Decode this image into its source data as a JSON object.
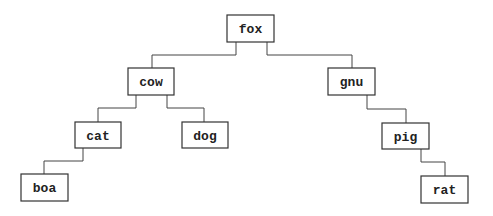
{
  "diagram": {
    "type": "binary-search-tree",
    "nodes": [
      {
        "id": "fox",
        "label": "fox",
        "x": 227,
        "y": 15,
        "w": 47,
        "h": 27
      },
      {
        "id": "cow",
        "label": "cow",
        "x": 128,
        "y": 68,
        "w": 46,
        "h": 27
      },
      {
        "id": "gnu",
        "label": "gnu",
        "x": 328,
        "y": 68,
        "w": 47,
        "h": 27
      },
      {
        "id": "cat",
        "label": "cat",
        "x": 75,
        "y": 122,
        "w": 46,
        "h": 26
      },
      {
        "id": "dog",
        "label": "dog",
        "x": 182,
        "y": 122,
        "w": 46,
        "h": 26
      },
      {
        "id": "pig",
        "label": "pig",
        "x": 382,
        "y": 123,
        "w": 47,
        "h": 26
      },
      {
        "id": "boa",
        "label": "boa",
        "x": 21,
        "y": 174,
        "w": 47,
        "h": 27
      },
      {
        "id": "rat",
        "label": "rat",
        "x": 421,
        "y": 176,
        "w": 47,
        "h": 27
      }
    ],
    "edges": [
      {
        "from": "fox",
        "to": "cow",
        "points": "236,42 236,55 152,55 152,68"
      },
      {
        "from": "fox",
        "to": "gnu",
        "points": "267,42 267,55 352,55 352,68"
      },
      {
        "from": "cow",
        "to": "cat",
        "points": "136,95 136,108 98,108 98,122"
      },
      {
        "from": "cow",
        "to": "dog",
        "points": "167,95 167,108 204,108 204,122"
      },
      {
        "from": "gnu",
        "to": "pig",
        "points": "367,95 367,109 406,109 406,123"
      },
      {
        "from": "cat",
        "to": "boa",
        "points": "83,148 83,161 44,161 44,174"
      },
      {
        "from": "pig",
        "to": "rat",
        "points": "421,149 421,162 445,162 445,176"
      }
    ]
  }
}
